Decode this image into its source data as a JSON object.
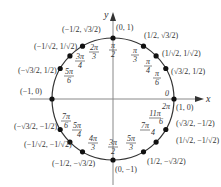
{
  "diagram": {
    "axes": {
      "x_label": "x",
      "y_label": "y"
    },
    "origin_label": "0",
    "center": [
      113,
      99
    ],
    "radius": 61,
    "points": [
      {
        "angle_deg": 0,
        "angle_label": "0",
        "angle_label2": "2π",
        "coord": "(1, 0)"
      },
      {
        "angle_deg": 30,
        "angle_label_num": "π",
        "angle_label_den": "6",
        "coord": "(√3/2, 1/2)"
      },
      {
        "angle_deg": 45,
        "angle_label_num": "π",
        "angle_label_den": "4",
        "coord": "(1/√2, 1/√2)"
      },
      {
        "angle_deg": 60,
        "angle_label_num": "π",
        "angle_label_den": "3",
        "coord": "(1/2, √3/2)"
      },
      {
        "angle_deg": 90,
        "angle_label_num": "π",
        "angle_label_den": "2",
        "coord": "(0, 1)"
      },
      {
        "angle_deg": 120,
        "angle_label_num": "2π",
        "angle_label_den": "3",
        "coord": "(−1/2, √3/2)"
      },
      {
        "angle_deg": 135,
        "angle_label_num": "3π",
        "angle_label_den": "4",
        "coord": "(−1/√2, 1/√2)"
      },
      {
        "angle_deg": 150,
        "angle_label_num": "5π",
        "angle_label_den": "6",
        "coord": "(−√3/2, 1/2)"
      },
      {
        "angle_deg": 180,
        "angle_label_num": "π",
        "angle_label_den": "",
        "coord": "(−1, 0)"
      },
      {
        "angle_deg": 210,
        "angle_label_num": "7π",
        "angle_label_den": "6",
        "coord": "(−√3/2, −1/2)"
      },
      {
        "angle_deg": 225,
        "angle_label_num": "5π",
        "angle_label_den": "4",
        "coord": "(−1/√2, −1/√2)"
      },
      {
        "angle_deg": 240,
        "angle_label_num": "4π",
        "angle_label_den": "3",
        "coord": "(−1/2, −√3/2)"
      },
      {
        "angle_deg": 270,
        "angle_label_num": "3π",
        "angle_label_den": "2",
        "coord": "(0, −1)"
      },
      {
        "angle_deg": 300,
        "angle_label_num": "5π",
        "angle_label_den": "3",
        "coord": "(1/2, −√3/2)"
      },
      {
        "angle_deg": 315,
        "angle_label_num": "7π",
        "angle_label_den": "4",
        "coord": "(1/√2, −1/√2)"
      },
      {
        "angle_deg": 330,
        "angle_label_num": "11π",
        "angle_label_den": "6",
        "coord": "(√3/2, −1/2)"
      }
    ]
  }
}
